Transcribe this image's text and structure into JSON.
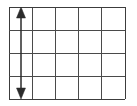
{
  "figure": {
    "title": "Grid with vertical double-headed dimension arrow",
    "type": "diagram",
    "background_color": "#ffffff",
    "grid": {
      "columns": 5,
      "rows": 4,
      "line_color": "#4a4a4a",
      "outer_line_color": "#3c3c3c",
      "cell_fill": "#ffffff",
      "left": 9,
      "top": 7,
      "right": 125,
      "bottom": 99,
      "column_x_positions": [
        9,
        32,
        55,
        78,
        101,
        125
      ],
      "row_y_positions": [
        7,
        30,
        53,
        76,
        99
      ]
    },
    "arrow": {
      "name": "vertical-double-headed-arrow",
      "direction": "double",
      "orientation": "vertical",
      "color": "#2b2b2b",
      "x": 21,
      "y_top": 8,
      "y_bottom": 98,
      "head_width": 9,
      "head_height": 11,
      "spans_rows": 4,
      "located_in_column": 1
    },
    "labels": []
  }
}
